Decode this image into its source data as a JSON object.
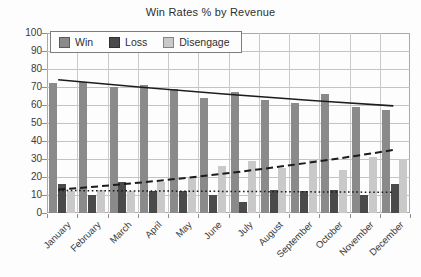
{
  "chart_data": {
    "type": "bar",
    "title": "Win Rates % by Revenue",
    "categories": [
      "January",
      "February",
      "March",
      "April",
      "May",
      "June",
      "July",
      "August",
      "September",
      "October",
      "November",
      "December"
    ],
    "series": [
      {
        "name": "Win",
        "color": "#8a8a8a",
        "values": [
          72,
          73,
          70,
          71,
          69,
          64,
          67,
          63,
          61,
          66,
          59,
          57
        ]
      },
      {
        "name": "Loss",
        "color": "#4a4a4a",
        "values": [
          16,
          10,
          17,
          12,
          12,
          10,
          6,
          13,
          12,
          13,
          10,
          16
        ]
      },
      {
        "name": "Disengage",
        "color": "#c9c9c9",
        "values": [
          12,
          13,
          12,
          17,
          20,
          26,
          29,
          25,
          30,
          24,
          31,
          30
        ]
      }
    ],
    "trendlines": [
      {
        "series": "Win",
        "style": "solid",
        "start": 74,
        "mid": 66,
        "end": 59.5
      },
      {
        "series": "Disengage",
        "style": "dashed",
        "start": 13,
        "mid": 22,
        "end": 35
      },
      {
        "series": "Loss",
        "style": "dotted",
        "start": 12.5,
        "mid": 12,
        "end": 11.5
      }
    ],
    "ylim": [
      0,
      100
    ],
    "yticks": [
      0,
      10,
      20,
      30,
      40,
      50,
      60,
      70,
      80,
      90,
      100
    ],
    "grid": "horizontal-and-vertical",
    "legend_position": "top-left-inside",
    "xlabel": "",
    "ylabel": ""
  },
  "colors": {
    "gridline": "#c3c3c3",
    "plot_border": "#a9a9a9",
    "trendline": "#1c1c1c",
    "text": "#3a3a3a",
    "background": "#fdfdfd"
  }
}
